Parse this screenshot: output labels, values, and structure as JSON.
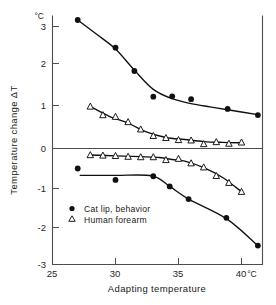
{
  "chart_data": {
    "type": "scatter",
    "title": "",
    "xlabel": "Adapting  temperature",
    "ylabel": "Temperature change ΔT",
    "x_unit": "°C",
    "y_unit": "°C",
    "xlim": [
      25,
      42.2
    ],
    "ylim": [
      -3,
      3.45
    ],
    "xticks": [
      25,
      30,
      35,
      40
    ],
    "xticklabels": [
      "25",
      "30",
      "35",
      "40"
    ],
    "yticks": [
      3,
      2,
      1,
      0,
      -1,
      -2,
      -3
    ],
    "yticklabels": [
      "3",
      "2",
      "1",
      "0",
      "-1",
      "-2",
      "-3"
    ],
    "grid": false,
    "zero_line": true,
    "legend_position": "lower-left",
    "legend": [
      {
        "label": "Cat lip, behavior",
        "marker": "filled-circle"
      },
      {
        "label": "Human forearm",
        "marker": "open-triangle"
      }
    ],
    "series": [
      {
        "name": "Cat lip, behavior (warm)",
        "marker": "filled-circle",
        "branch": "upper",
        "points": [
          [
            27.0,
            3.15
          ],
          [
            30.0,
            2.47
          ],
          [
            31.5,
            1.9
          ],
          [
            33.0,
            1.27
          ],
          [
            34.5,
            1.28
          ],
          [
            36.0,
            1.21
          ],
          [
            38.9,
            0.97
          ],
          [
            41.3,
            0.82
          ]
        ]
      },
      {
        "name": "Human forearm (warm)",
        "marker": "open-triangle",
        "branch": "upper",
        "points": [
          [
            28.0,
            1.03
          ],
          [
            29.0,
            0.82
          ],
          [
            30.0,
            0.78
          ],
          [
            31.0,
            0.65
          ],
          [
            32.0,
            0.47
          ],
          [
            33.0,
            0.31
          ],
          [
            34.0,
            0.26
          ],
          [
            35.0,
            0.21
          ],
          [
            36.0,
            0.2
          ],
          [
            37.0,
            0.11
          ],
          [
            38.0,
            0.16
          ],
          [
            39.0,
            0.12
          ],
          [
            40.0,
            0.15
          ]
        ]
      },
      {
        "name": "Cat lip, behavior (cool)",
        "marker": "filled-circle",
        "branch": "lower",
        "points": [
          [
            27.0,
            -0.49
          ],
          [
            30.0,
            -0.77
          ],
          [
            33.0,
            -0.68
          ],
          [
            34.3,
            -0.93
          ],
          [
            35.8,
            -1.24
          ],
          [
            38.8,
            -1.7
          ],
          [
            41.3,
            -2.38
          ]
        ]
      },
      {
        "name": "Human forearm (cool)",
        "marker": "open-triangle",
        "branch": "lower",
        "points": [
          [
            28.0,
            -0.16
          ],
          [
            29.0,
            -0.17
          ],
          [
            30.0,
            -0.18
          ],
          [
            31.0,
            -0.2
          ],
          [
            32.0,
            -0.21
          ],
          [
            33.0,
            -0.21
          ],
          [
            34.0,
            -0.28
          ],
          [
            35.0,
            -0.25
          ],
          [
            36.0,
            -0.36
          ],
          [
            37.0,
            -0.46
          ],
          [
            38.0,
            -0.67
          ],
          [
            39.0,
            -0.84
          ],
          [
            40.0,
            -1.06
          ]
        ]
      }
    ],
    "fit_curves": [
      {
        "name": "Cat lip upper fit",
        "points": [
          [
            27.0,
            3.15
          ],
          [
            28.5,
            2.8
          ],
          [
            30.0,
            2.44
          ],
          [
            31.5,
            1.92
          ],
          [
            33.0,
            1.45
          ],
          [
            34.5,
            1.22
          ],
          [
            36.0,
            1.1
          ],
          [
            37.5,
            1.02
          ],
          [
            38.9,
            0.95
          ],
          [
            41.3,
            0.83
          ]
        ]
      },
      {
        "name": "Human forearm upper fit",
        "points": [
          [
            28.0,
            1.03
          ],
          [
            29.5,
            0.79
          ],
          [
            31.0,
            0.62
          ],
          [
            32.5,
            0.4
          ],
          [
            34.0,
            0.27
          ],
          [
            35.5,
            0.22
          ],
          [
            37.0,
            0.17
          ],
          [
            38.5,
            0.15
          ],
          [
            40.0,
            0.14
          ]
        ]
      },
      {
        "name": "Cat lip lower fit",
        "points": [
          [
            27.2,
            -0.66
          ],
          [
            30.0,
            -0.66
          ],
          [
            32.9,
            -0.67
          ],
          [
            34.3,
            -0.93
          ],
          [
            35.8,
            -1.24
          ],
          [
            38.8,
            -1.72
          ],
          [
            41.3,
            -2.38
          ]
        ]
      },
      {
        "name": "Human forearm lower fit",
        "points": [
          [
            28.0,
            -0.16
          ],
          [
            30.0,
            -0.18
          ],
          [
            32.0,
            -0.2
          ],
          [
            33.5,
            -0.22
          ],
          [
            34.5,
            -0.27
          ],
          [
            35.5,
            -0.31
          ],
          [
            37.0,
            -0.47
          ],
          [
            38.5,
            -0.71
          ],
          [
            40.0,
            -1.06
          ]
        ]
      }
    ]
  },
  "axes": {
    "y_unit_label": "°C",
    "x_unit_label": "°C",
    "x_title": "Adapting  temperature",
    "y_title": "Temperature change ΔT"
  },
  "legend": {
    "entry_1": "Cat lip, behavior",
    "entry_2": "Human forearm"
  },
  "colors": {
    "ink": "#111111",
    "axis": "#4d4d4d",
    "background": "#ffffff",
    "marker_fill": "#111111",
    "triangle_fill": "#ffffff"
  }
}
